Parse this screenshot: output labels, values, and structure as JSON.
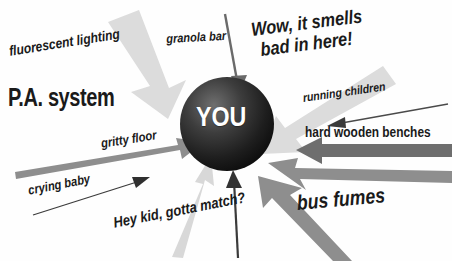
{
  "diagram": {
    "title": "",
    "center": {
      "label": "YOU",
      "shape": "sphere",
      "fill_dark": "#111111",
      "fill_mid": "#3a3a3a",
      "fill_light": "#6e6e6e",
      "text_color": "#ffffff"
    },
    "colors": {
      "background": "#ffffff",
      "text": "#1a1a1a",
      "arrow_pale": "#dcdcdc",
      "arrow_light": "#c9c9c9",
      "arrow_medium": "#8e8e8e",
      "arrow_dark": "#5e5e5e",
      "arrow_thin": "#3b3b3b"
    },
    "stimuli": [
      {
        "id": "fluorescent-lighting",
        "label": "fluorescent lighting",
        "arrow_style": "thick-pale",
        "arrow_color": "#dcdcdc",
        "direction": "from top-left toward center"
      },
      {
        "id": "pa-system",
        "label": "P.A. system",
        "arrow_style": "none-large-text",
        "arrow_color": "#dcdcdc",
        "direction": "left side emphasis"
      },
      {
        "id": "granola-bar",
        "label": "granola bar",
        "arrow_style": "thin",
        "arrow_color": "#6a6a6a",
        "direction": "from top down into center"
      },
      {
        "id": "smell-complaint",
        "label_line1": "Wow, it smells",
        "label_line2": "bad in here!",
        "arrow_style": "thick-pale",
        "arrow_color": "#dcdcdc",
        "direction": "from upper-right toward center"
      },
      {
        "id": "running-children",
        "label": "running children",
        "arrow_style": "thin",
        "arrow_color": "#4a4a4a",
        "direction": "from right pointing left"
      },
      {
        "id": "hard-wooden-benches",
        "label": "hard wooden benches",
        "arrow_style": "thick-block",
        "arrow_color": "#6e6e6e",
        "direction": "from right pointing left into center"
      },
      {
        "id": "gritty-floor",
        "label": "gritty floor",
        "arrow_style": "tapered",
        "arrow_color": "#8e8e8e",
        "direction": "from left pointing right into center"
      },
      {
        "id": "crying-baby",
        "label": "crying baby",
        "arrow_style": "thin",
        "arrow_color": "#3b3b3b",
        "direction": "from lower-left pointing up-right"
      },
      {
        "id": "match-request",
        "label": "Hey kid, gotta match?",
        "arrow_style": "tapered-pale",
        "arrow_color": "#d8d8d8",
        "direction": "from bottom pointing up into center"
      },
      {
        "id": "bus-fumes",
        "label": "bus fumes",
        "arrow_style": "tapered-double",
        "arrow_color": "#8e8e8e",
        "direction": "from lower-right pointing up-left into center"
      },
      {
        "id": "unlabeled-vertical",
        "label": "",
        "arrow_style": "thin",
        "arrow_color": "#3b3b3b",
        "direction": "from bottom pointing up into center"
      }
    ]
  }
}
